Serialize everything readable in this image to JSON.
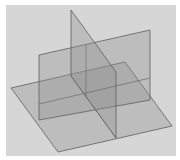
{
  "diagram": {
    "title": "",
    "colors": {
      "page": "#ffffff",
      "background": "#d6d6d6",
      "plane_fill": "#8f8f8f",
      "plane_edge": "#5e5e5e"
    },
    "planes": [
      {
        "id": "horizontal-plane",
        "label": ""
      },
      {
        "id": "vertical-plane-front",
        "label": ""
      },
      {
        "id": "vertical-plane-side",
        "label": ""
      }
    ]
  }
}
